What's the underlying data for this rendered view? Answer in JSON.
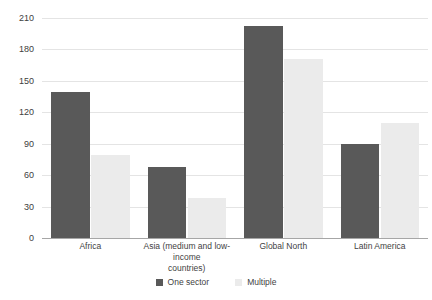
{
  "chart_data": {
    "type": "bar",
    "title": "",
    "subtitle": "",
    "xlabel": "",
    "ylabel": "",
    "categories": [
      "Africa",
      "Asia (medium and low-income countries)",
      "Global North",
      "Latin America"
    ],
    "category_lines": [
      [
        "Africa"
      ],
      [
        "Asia (medium and low-income",
        "countries)"
      ],
      [
        "Global North"
      ],
      [
        "Latin America"
      ]
    ],
    "series": [
      {
        "name": "One sector",
        "color": "#595959",
        "values": [
          139,
          68,
          202,
          90
        ]
      },
      {
        "name": "Multiple",
        "color": "#ebebeb",
        "values": [
          79,
          38,
          171,
          110
        ]
      }
    ],
    "ylim": [
      0,
      210
    ],
    "yticks": [
      0,
      30,
      60,
      90,
      120,
      150,
      180,
      210
    ],
    "ytick_labels": [
      "0",
      "30",
      "60",
      "90",
      "120",
      "150",
      "180",
      "210"
    ],
    "grid": true,
    "grid_color": "#e4e4e4",
    "axis_color": "#a6a6a6",
    "legend": {
      "position": "bottom",
      "entries": [
        {
          "label": "One sector",
          "color": "#595959"
        },
        {
          "label": "Multiple",
          "color": "#ebebeb"
        }
      ]
    }
  }
}
